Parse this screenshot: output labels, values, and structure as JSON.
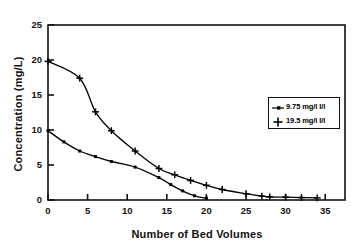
{
  "chart_data": {
    "type": "line",
    "title": "",
    "xlabel": "Number of Bed Volumes",
    "ylabel": "Concentration (mg/L)",
    "xlim": [
      0,
      37.5
    ],
    "ylim": [
      0,
      25
    ],
    "xticks": [
      0,
      5,
      10,
      15,
      20,
      25,
      30,
      35
    ],
    "xtick_labels": [
      "0",
      "5",
      "10",
      "15",
      "20",
      "25",
      "30",
      "35"
    ],
    "yticks": [
      0,
      5,
      10,
      15,
      20,
      25
    ],
    "ytick_labels": [
      "0",
      "5",
      "10",
      "15",
      "20",
      "25"
    ],
    "grid": false,
    "legend_position": "right",
    "series": [
      {
        "name": "9.75 mg/l I/l",
        "marker": "square-dot",
        "x": [
          0,
          2,
          4,
          6,
          8,
          11,
          14,
          15.5,
          17,
          18.5,
          20
        ],
        "y": [
          9.9,
          8.3,
          7.0,
          6.2,
          5.5,
          4.7,
          3.2,
          2.2,
          1.3,
          0.6,
          0.25
        ]
      },
      {
        "name": "19.5 mg/l I/l",
        "marker": "plus",
        "x": [
          0,
          4,
          6,
          8,
          11,
          14,
          16,
          18,
          20,
          22,
          25,
          27,
          28,
          30,
          32,
          34
        ],
        "y": [
          19.8,
          17.4,
          12.6,
          9.9,
          7.0,
          4.5,
          3.6,
          2.8,
          2.1,
          1.5,
          0.9,
          0.55,
          0.45,
          0.4,
          0.35,
          0.3
        ]
      }
    ]
  },
  "legend": {
    "entries": [
      {
        "label": "9.75 mg/l I/l",
        "symbol": "square-dot-marker"
      },
      {
        "label": "19.5 mg/l I/l",
        "symbol": "plus-marker"
      }
    ]
  },
  "colors": {
    "axis": "#111111",
    "series_1": "#000000",
    "series_2": "#000000",
    "background": "#ffffff"
  }
}
